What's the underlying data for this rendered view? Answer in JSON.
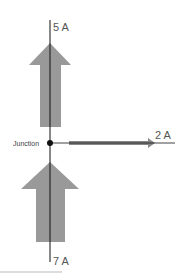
{
  "diagram": {
    "junction_label": "Junction",
    "currents": [
      {
        "id": "top",
        "label": "5 A",
        "direction": "out-up"
      },
      {
        "id": "right",
        "label": "2 A",
        "direction": "out-right"
      },
      {
        "id": "bottom",
        "label": "7 A",
        "direction": "in-up"
      }
    ],
    "colors": {
      "arrow": "#999999",
      "wire": "#111111",
      "junction_dot": "#111111",
      "text": "#555555"
    }
  }
}
